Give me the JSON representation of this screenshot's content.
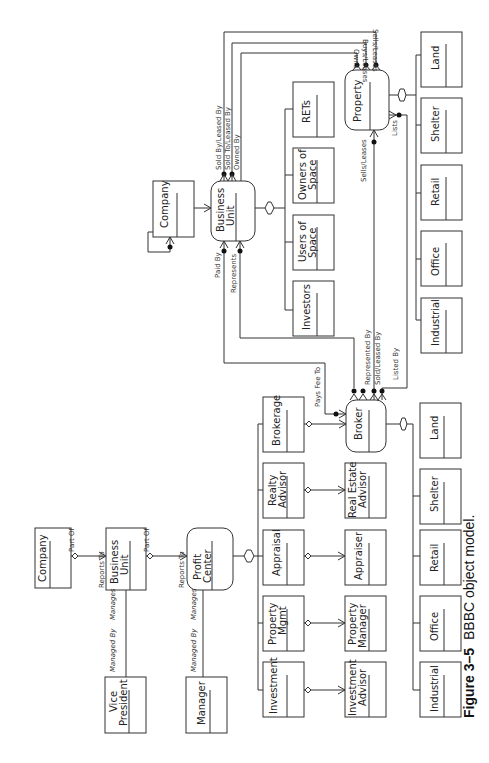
{
  "caption": {
    "figure": "Figure 3–5",
    "title": "BBBC object model."
  },
  "entities": {
    "company_left": [
      "Company"
    ],
    "business_unit_left": [
      "Business",
      "Unit"
    ],
    "profit_center": [
      "Profit",
      "Center"
    ],
    "vice_president": [
      "Vice",
      "President"
    ],
    "manager": [
      "Manager"
    ],
    "investment": [
      "Investment"
    ],
    "property_mgmt": [
      "Property",
      "Mgmt"
    ],
    "appraisal": [
      "Appraisal"
    ],
    "realty_advisor": [
      "Realty",
      "Advisor"
    ],
    "brokerage": [
      "Brokerage"
    ],
    "investment_advisor": [
      "Investment",
      "Advisor"
    ],
    "property_manager": [
      "Property",
      "Manager"
    ],
    "appraiser": [
      "Appraiser"
    ],
    "real_estate_advisor": [
      "Real Estate",
      "Advisor"
    ],
    "broker": [
      "Broker"
    ],
    "bottom_types": [
      "Industrial",
      "Office",
      "Retail",
      "Shelter",
      "Land"
    ],
    "company_top": [
      "Company"
    ],
    "business_unit_top": [
      "Business",
      "Unit"
    ],
    "bu_subtypes": [
      [
        "Investors"
      ],
      [
        "Users of",
        "Space"
      ],
      [
        "Owners of",
        "Space"
      ],
      [
        "RETs"
      ]
    ],
    "property": [
      "Property"
    ],
    "property_types": [
      "Industrial",
      "Office",
      "Retail",
      "Shelter",
      "Land"
    ]
  },
  "relationships": {
    "part_of": "Part Of",
    "reports_to": "Reports To",
    "managed_by": "Managed By",
    "manages": "Manages",
    "pays_fee_to": "Pays Fee To",
    "represented_by": "Represented By",
    "sold_leased_by": "Sold/Leased By",
    "listed_by": "Listed By",
    "paid_by": "Paid By",
    "represents": "Represents",
    "sold_by_leased_by": "Sold By/Leased By",
    "sold_to_leased_by": "Sold To/Leased By",
    "owned_by": "Owned By",
    "sells_leases": "Sells/Leases",
    "buys_leases": "Buys/Leases",
    "owns": "Owns",
    "lists": "Lists"
  }
}
